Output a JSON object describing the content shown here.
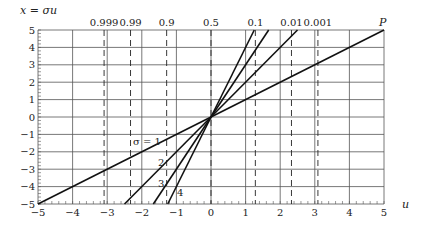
{
  "chart_data": {
    "type": "line",
    "title": "",
    "xlabel": "u",
    "ylabel": "x = σu",
    "xlim": [
      -5,
      5
    ],
    "ylim": [
      -5,
      5
    ],
    "grid": true,
    "x_ticks": [
      -5,
      -4,
      -3,
      -2,
      -1,
      0,
      1,
      2,
      3,
      4,
      5
    ],
    "y_ticks": [
      -5,
      -4,
      -3,
      -2,
      -1,
      0,
      1,
      2,
      3,
      4,
      5
    ],
    "x_tick_labels": [
      "−5",
      "−4",
      "−3",
      "−2",
      "−1",
      "0",
      "1",
      "2",
      "3",
      "4",
      "5"
    ],
    "y_tick_labels": [
      "−5",
      "−4",
      "−3",
      "−2",
      "−1",
      "0",
      "1",
      "2",
      "3",
      "4",
      "5"
    ],
    "series": [
      {
        "name": "σ = 1",
        "sigma": 1,
        "label": "σ = 1",
        "x": [
          -5,
          5
        ],
        "y": [
          -5,
          5
        ]
      },
      {
        "name": "σ = 2",
        "sigma": 2,
        "label": "2",
        "x": [
          -2.5,
          2.5
        ],
        "y": [
          -5,
          5
        ]
      },
      {
        "name": "σ = 3",
        "sigma": 3,
        "label": "3",
        "x": [
          -1.667,
          1.667
        ],
        "y": [
          -5,
          5
        ]
      },
      {
        "name": "σ = 4",
        "sigma": 4,
        "label": "4",
        "x": [
          -1.25,
          1.25
        ],
        "y": [
          -5,
          5
        ]
      }
    ],
    "quantile_lines": [
      {
        "label": "0.999",
        "u": -3.09
      },
      {
        "label": "0.99",
        "u": -2.326
      },
      {
        "label": "0.9",
        "u": -1.282
      },
      {
        "label": "0.5",
        "u": 0
      },
      {
        "label": "0.1",
        "u": 1.282
      },
      {
        "label": "0.01",
        "u": 2.326
      },
      {
        "label": "0.001",
        "u": 3.09
      }
    ],
    "annotations": [
      {
        "text": "P",
        "x": 5,
        "y": 5
      }
    ]
  },
  "labels": {
    "y_axis_title": "x = σu",
    "x_axis_title": "u",
    "point_label": "P",
    "sigma1": "σ = 1",
    "sigma2": "2",
    "sigma3": "3",
    "sigma4": "4"
  }
}
